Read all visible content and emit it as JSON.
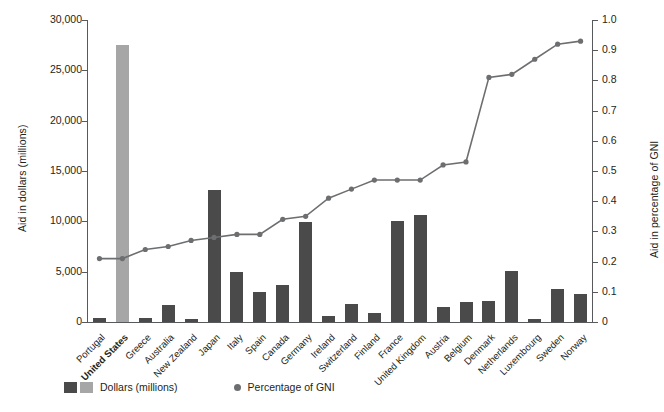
{
  "chart_data": {
    "type": "bar",
    "title": "",
    "xlabel": "",
    "ylabel": "Aid in dollars (millions)",
    "y2label": "Aid in percentage of GNI",
    "ylim": [
      0,
      30000
    ],
    "y2lim": [
      0,
      1.0
    ],
    "grid": false,
    "legend_position": "bottom-left",
    "y_ticks": [
      "0",
      "5,000",
      "10,000",
      "15,000",
      "20,000",
      "25,000",
      "30,000"
    ],
    "y_tick_values": [
      0,
      5000,
      10000,
      15000,
      20000,
      25000,
      30000
    ],
    "y2_ticks": [
      "0",
      "0.1",
      "0.2",
      "0.3",
      "0.4",
      "0.5",
      "0.6",
      "0.7",
      "0.8",
      "0.9",
      "1.0"
    ],
    "y2_tick_values": [
      0,
      0.1,
      0.2,
      0.3,
      0.4,
      0.5,
      0.6,
      0.7,
      0.8,
      0.9,
      1.0
    ],
    "categories": [
      "Portugal",
      "United States",
      "Greece",
      "Australia",
      "New Zealand",
      "Japan",
      "Italy",
      "Spain",
      "Canada",
      "Germany",
      "Ireland",
      "Switzerland",
      "Finland",
      "France",
      "United Kingdom",
      "Austria",
      "Belgium",
      "Denmark",
      "Netherlands",
      "Luxembourg",
      "Sweden",
      "Norway"
    ],
    "highlighted_category": "United States",
    "series": [
      {
        "name": "Dollars (millions)",
        "axis": "left",
        "type": "bar",
        "color": "#4a4a4a",
        "highlight_color": "#a6a6a6",
        "values": [
          400,
          27500,
          400,
          1700,
          250,
          13100,
          5000,
          3000,
          3700,
          9900,
          600,
          1800,
          900,
          10000,
          10600,
          1500,
          2000,
          2100,
          5100,
          250,
          3300,
          2800
        ]
      },
      {
        "name": "Percentage of GNI",
        "axis": "right",
        "type": "line",
        "color": "#6d6e70",
        "values": [
          0.21,
          0.21,
          0.24,
          0.25,
          0.27,
          0.28,
          0.29,
          0.29,
          0.34,
          0.35,
          0.41,
          0.44,
          0.47,
          0.47,
          0.47,
          0.52,
          0.53,
          0.81,
          0.82,
          0.87,
          0.92,
          0.93
        ]
      }
    ]
  },
  "legend": {
    "bars_label": "Dollars (millions)",
    "line_label": "Percentage of GNI"
  }
}
